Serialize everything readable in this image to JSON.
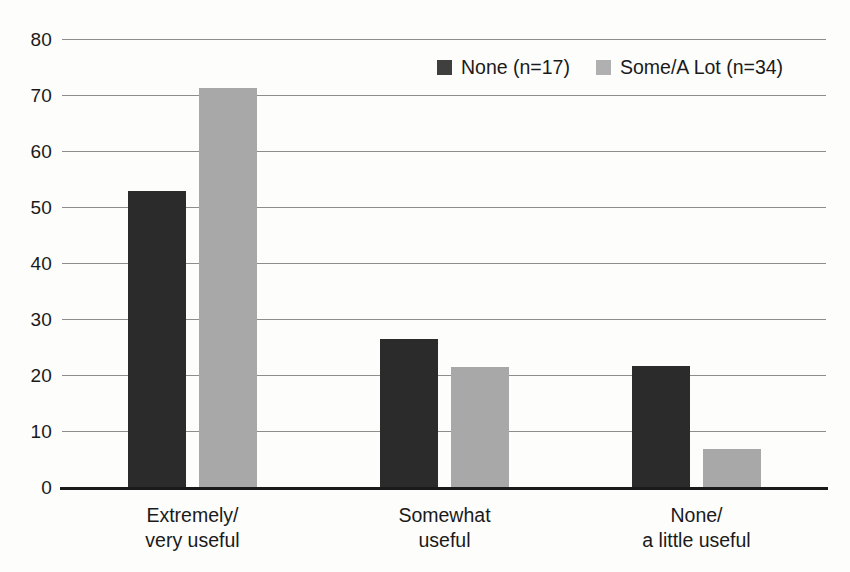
{
  "chart_data": {
    "type": "bar",
    "title": "",
    "subtitle": "",
    "xlabel": "",
    "ylabel": "",
    "ylim": [
      0,
      80
    ],
    "ytick_step": 10,
    "yticks": [
      "80",
      "70",
      "60",
      "50",
      "40",
      "30",
      "20",
      "10",
      "0"
    ],
    "grid": true,
    "legend_position": "top-center",
    "categories": [
      "Extremely/\nvery useful",
      "Somewhat\nuseful",
      "None/\na little useful"
    ],
    "category_lines": [
      [
        "Extremely/",
        "very useful"
      ],
      [
        "Somewhat",
        "useful"
      ],
      [
        "None/",
        "a little useful"
      ]
    ],
    "series": [
      {
        "name": "None (n=17)",
        "color": "#2b2b2b",
        "values": [
          52.9,
          26.5,
          21.6
        ]
      },
      {
        "name": "Some/A Lot (n=34)",
        "color": "#a8a8a8",
        "values": [
          71.2,
          21.4,
          6.7
        ]
      }
    ]
  },
  "legend": {
    "entries": [
      {
        "label": "None (n=17)",
        "swatch": "dark-swatch-icon"
      },
      {
        "label": "Some/A Lot (n=34)",
        "swatch": "gray-swatch-icon"
      }
    ]
  },
  "axis": {
    "y_ticks": [
      "80",
      "70",
      "60",
      "50",
      "40",
      "30",
      "20",
      "10",
      "0"
    ]
  }
}
